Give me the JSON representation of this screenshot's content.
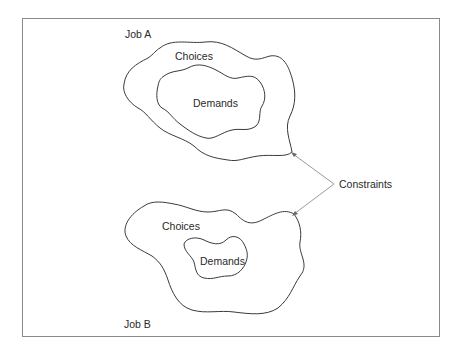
{
  "diagram": {
    "job_a": {
      "label": "Job A",
      "outer_label": "Choices",
      "inner_label": "Demands"
    },
    "job_b": {
      "label": "Job B",
      "outer_label": "Choices",
      "inner_label": "Demands"
    },
    "shared_label": "Constraints",
    "colors": {
      "stroke": "#3a3a3a",
      "arrow": "#9a9a9a",
      "frame": "#8a8a8a",
      "text": "#2a2a2a"
    }
  }
}
